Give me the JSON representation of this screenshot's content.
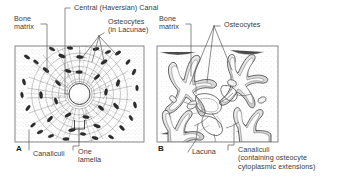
{
  "figure": {
    "background_color": "#ffffff",
    "ink_color": "#3b3b3b",
    "line_art_color": "#4a4a4a"
  },
  "panels": [
    {
      "letter": "A",
      "name": "osteon-cross-section",
      "frame": {
        "x": 15,
        "y": 46,
        "w": 129,
        "h": 96
      }
    },
    {
      "letter": "B",
      "name": "osteocyte-detail",
      "frame": {
        "x": 157,
        "y": 46,
        "w": 121,
        "h": 96
      }
    }
  ],
  "labels": {
    "panel_a": {
      "bone_matrix": "Bone\nmatrix",
      "central_canal": "Central (Haversian) Canal",
      "osteocytes": "Osteocytes\n(in Lacunae)",
      "canaliculi": "Canaliculi",
      "one_lamella": "One\nlamella"
    },
    "panel_b": {
      "bone_matrix": "Bone\nmatrix",
      "osteocytes": "Osteocytes",
      "lacuna": "Lacuna",
      "canaliculi": "Canaliculi\n(containing osteocyte\ncytoplasmic extensions)"
    }
  },
  "panel_letters": {
    "a": "A",
    "b": "B"
  }
}
